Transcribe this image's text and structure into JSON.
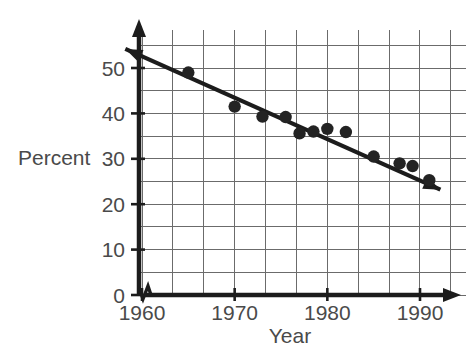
{
  "chart_data": {
    "type": "scatter",
    "title": "",
    "xlabel": "Year",
    "ylabel": "Percent",
    "xlim": [
      1958,
      1992.5
    ],
    "ylim": [
      0,
      55
    ],
    "grid": true,
    "legend": "none",
    "x_ticks": [
      1960,
      1970,
      1980,
      1990
    ],
    "x_tick_labels": [
      "1960",
      "1970",
      "1980",
      "1990"
    ],
    "y_ticks": [
      0,
      10,
      20,
      30,
      40,
      50
    ],
    "y_tick_labels": [
      "0",
      "10",
      "20",
      "30",
      "40",
      "50"
    ],
    "y_minor_step": 5,
    "x_minor_step": 3.333,
    "axis_break": "y-axis break near origin",
    "series": [
      {
        "name": "Percent",
        "marker": "filled-circle",
        "points": [
          {
            "x": 1965,
            "y": 49
          },
          {
            "x": 1970,
            "y": 41.5
          },
          {
            "x": 1973,
            "y": 39.3
          },
          {
            "x": 1975.5,
            "y": 39.2
          },
          {
            "x": 1977,
            "y": 35.6
          },
          {
            "x": 1978.5,
            "y": 36
          },
          {
            "x": 1980,
            "y": 36.6
          },
          {
            "x": 1982,
            "y": 35.9
          },
          {
            "x": 1985,
            "y": 30.5
          },
          {
            "x": 1987.8,
            "y": 29
          },
          {
            "x": 1989.2,
            "y": 28.4
          },
          {
            "x": 1991,
            "y": 25.3
          }
        ]
      }
    ],
    "trend_line": {
      "name": "best-fit line",
      "style": "solid double-arrow",
      "x_start": 1958.2,
      "y_start": 54.2,
      "x_end": 1992.2,
      "y_end": 23.2
    }
  },
  "colors": {
    "marker": "#232323",
    "trend": "#1c1c1c",
    "grid": "#6b6b6b",
    "axis": "#1c1c1c",
    "text": "#4a4a4a",
    "background": "#ffffff"
  },
  "axes": {
    "y_axis_label": "Percent",
    "x_axis_label": "Year"
  }
}
